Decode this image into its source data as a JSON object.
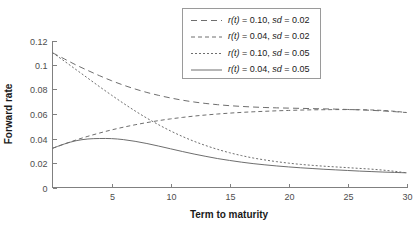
{
  "chart_data": {
    "type": "line",
    "title": "",
    "xlabel": "Term to maturity",
    "ylabel": "Forward rate",
    "xlim": [
      0,
      30
    ],
    "ylim": [
      0,
      0.12
    ],
    "grid": false,
    "legend_position": "top-center",
    "xticks": [
      5,
      10,
      15,
      20,
      25,
      30
    ],
    "xtick_labels": [
      "5",
      "10",
      "15",
      "20",
      "25",
      "30"
    ],
    "yticks": [
      0,
      0.02,
      0.04,
      0.06,
      0.08,
      0.1,
      0.12
    ],
    "ytick_labels": [
      "0",
      "0.02",
      "0.04",
      "0.06",
      "0.08",
      "0.1",
      "0.12"
    ],
    "x": [
      0,
      1,
      2,
      3,
      4,
      5,
      6,
      7,
      8,
      9,
      10,
      11,
      12,
      13,
      14,
      15,
      16,
      17,
      18,
      19,
      20,
      21,
      22,
      23,
      24,
      25,
      26,
      27,
      28,
      29,
      30
    ],
    "series": [
      {
        "name": "r(t) = 0.10, sd = 0.02",
        "r0": 0.1,
        "sd": 0.02,
        "dash": "6,4",
        "color": "#6e6e6e",
        "values": [
          0.11,
          0.105,
          0.1,
          0.0955,
          0.0912,
          0.0872,
          0.0836,
          0.0804,
          0.0776,
          0.0752,
          0.0731,
          0.0713,
          0.0698,
          0.0686,
          0.0676,
          0.0668,
          0.0662,
          0.0657,
          0.0653,
          0.065,
          0.0648,
          0.0646,
          0.0644,
          0.0642,
          0.064,
          0.0637,
          0.0634,
          0.063,
          0.0625,
          0.0619,
          0.0612
        ]
      },
      {
        "name": "r(t) = 0.04, sd = 0.02",
        "r0": 0.04,
        "sd": 0.02,
        "dash": "4,3",
        "color": "#6e6e6e",
        "values": [
          0.032,
          0.0355,
          0.0388,
          0.0418,
          0.0445,
          0.047,
          0.0492,
          0.0512,
          0.053,
          0.0546,
          0.056,
          0.0572,
          0.0583,
          0.0592,
          0.06,
          0.0607,
          0.0613,
          0.0618,
          0.0622,
          0.0626,
          0.0629,
          0.0632,
          0.0634,
          0.0635,
          0.0636,
          0.0636,
          0.0635,
          0.0633,
          0.0629,
          0.0622,
          0.0612
        ]
      },
      {
        "name": "r(t) = 0.10, sd = 0.05",
        "r0": 0.1,
        "sd": 0.05,
        "dash": "2,2",
        "color": "#6e6e6e",
        "values": [
          0.11,
          0.1032,
          0.0962,
          0.0892,
          0.0822,
          0.0754,
          0.0688,
          0.0625,
          0.0566,
          0.0512,
          0.0462,
          0.0417,
          0.0377,
          0.0342,
          0.0311,
          0.0284,
          0.0261,
          0.0241,
          0.0225,
          0.0211,
          0.0199,
          0.0189,
          0.0181,
          0.0174,
          0.0168,
          0.0162,
          0.0156,
          0.015,
          0.0142,
          0.0132,
          0.012
        ]
      },
      {
        "name": "r(t) = 0.04, sd = 0.05",
        "r0": 0.04,
        "sd": 0.05,
        "dash": "none",
        "color": "#6e6e6e",
        "values": [
          0.032,
          0.0355,
          0.0382,
          0.0396,
          0.04,
          0.0399,
          0.0391,
          0.0377,
          0.0359,
          0.0338,
          0.0316,
          0.0294,
          0.0273,
          0.0254,
          0.0236,
          0.0221,
          0.0207,
          0.0195,
          0.0185,
          0.0176,
          0.0168,
          0.0161,
          0.0155,
          0.0149,
          0.0144,
          0.0139,
          0.0134,
          0.013,
          0.0126,
          0.0123,
          0.012
        ]
      }
    ]
  },
  "legend": {
    "entries": [
      {
        "prefix_r": "r",
        "paren_t": "(t)",
        "eq1": " = 0.10, ",
        "sd": "sd",
        "eq2": " = 0.02"
      },
      {
        "prefix_r": "r",
        "paren_t": "(t)",
        "eq1": " = 0.04, ",
        "sd": "sd",
        "eq2": " = 0.02"
      },
      {
        "prefix_r": "r",
        "paren_t": "(t)",
        "eq1": " = 0.10, ",
        "sd": "sd",
        "eq2": " = 0.05"
      },
      {
        "prefix_r": "r",
        "paren_t": "(t)",
        "eq1": " = 0.04, ",
        "sd": "sd",
        "eq2": " = 0.05"
      }
    ]
  },
  "colors": {
    "line": "#6e6e6e",
    "axis": "#808080",
    "text": "#1a1a1a",
    "tick_text": "#4d4d4d",
    "legend_border": "#9a9a9a",
    "background": "#ffffff"
  }
}
